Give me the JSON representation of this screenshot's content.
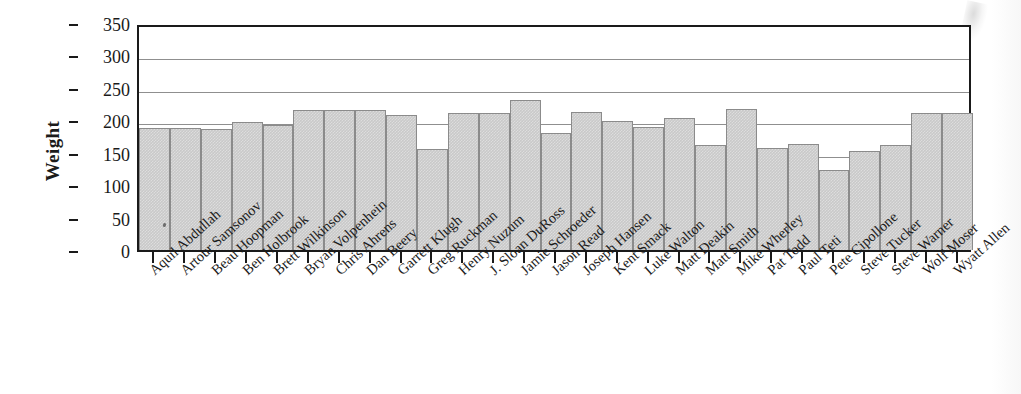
{
  "chart_data": {
    "type": "bar",
    "title": "",
    "xlabel": "",
    "ylabel": "Weight",
    "ylim": [
      0,
      350
    ],
    "yticks": [
      0,
      50,
      100,
      150,
      200,
      250,
      300,
      350
    ],
    "gridlines": [
      50,
      100,
      150,
      200,
      250,
      300
    ],
    "grid": true,
    "legend": "none",
    "categories": [
      "Aquil Abdullah",
      "Artour Samsonov",
      "Beau Hoopman",
      "Ben Holbrook",
      "Brett Wilkinson",
      "Bryan Volpenhein",
      "Chris Ahrens",
      "Dan Beery",
      "Garrett Klugh",
      "Greg Ruckman",
      "Henry Nuzum",
      "J. Sloan DuRoss",
      "Jamie Schroeder",
      "Jason Read",
      "Joseph Hansen",
      "Kent Smack",
      "Luke Walton",
      "Matt Deakin",
      "Matt Smith",
      "Mike Wherley",
      "Pat Todd",
      "Paul Teti",
      "Pete Cipollone",
      "Steve Tucker",
      "Steve Warner",
      "Wolf Moser",
      "Wyatt Allen"
    ],
    "values": [
      188,
      188,
      187,
      197,
      192,
      216,
      216,
      216,
      208,
      155,
      212,
      212,
      231,
      181,
      213,
      199,
      189,
      203,
      162,
      218,
      158,
      163,
      123,
      153,
      162,
      212,
      212
    ]
  },
  "axis": {
    "y_tick_labels": [
      "350",
      "300",
      "250",
      "200",
      "150",
      "100",
      "50",
      "0"
    ],
    "y_axis_title": "Weight"
  }
}
